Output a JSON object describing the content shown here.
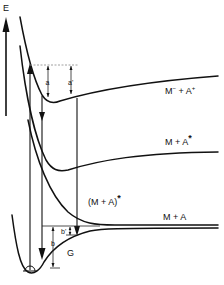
{
  "diagram": {
    "axis": {
      "label": "E",
      "direction": "up"
    },
    "states": [
      {
        "id": "ion-pair",
        "label_main": "M",
        "label_sup1": "−",
        "label_mid": " + A",
        "label_sup2": "+"
      },
      {
        "id": "excited-acceptor",
        "label_main": "M + A",
        "label_sup": "*"
      },
      {
        "id": "exciplex",
        "label_main": "(M + A)",
        "label_sup": "*"
      },
      {
        "id": "ground-dissociated",
        "label_main": "M + A"
      },
      {
        "id": "ground-complex",
        "label_main": "G"
      }
    ],
    "energy_gaps": {
      "a": "a",
      "a_prime": "a'",
      "b": "b",
      "b_prime": "b'"
    },
    "colors": {
      "line": "#111111",
      "guide": "#888888",
      "background": "#ffffff"
    }
  }
}
